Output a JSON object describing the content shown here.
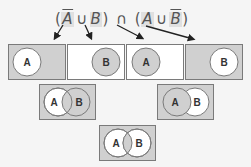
{
  "formula": {
    "open1": "(",
    "lit1": "A",
    "lit1_complement": true,
    "union1": "∪",
    "lit2": "B",
    "close1": ")",
    "intersect": "∩",
    "open2": "(",
    "lit3": "A",
    "union2": "∪",
    "lit4": "B",
    "lit4_complement": true,
    "close2": ")"
  },
  "colors": {
    "shaded": "#d0d0d0",
    "unshaded": "#ffffff",
    "border": "#7a7a7a",
    "arrow": "#222222"
  },
  "venn": {
    "box1": {
      "label": "A",
      "meaning": "not A"
    },
    "box2": {
      "label": "B",
      "meaning": "B"
    },
    "box3": {
      "label": "A",
      "meaning": "A"
    },
    "box4": {
      "label": "B",
      "meaning": "not B"
    },
    "box5": {
      "labelA": "A",
      "labelB": "B",
      "meaning": "not A or B"
    },
    "box6": {
      "labelA": "A",
      "labelB": "B",
      "meaning": "A or not B"
    },
    "box7": {
      "labelA": "A",
      "labelB": "B",
      "meaning": "result"
    }
  }
}
